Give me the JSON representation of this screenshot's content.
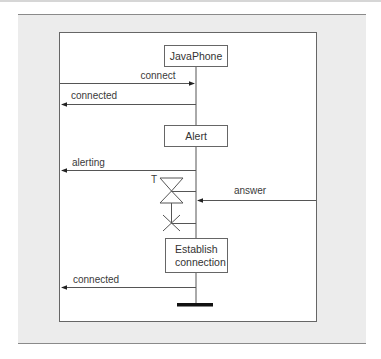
{
  "diagram": {
    "type": "sequence-diagram",
    "lifeline": "JavaPhone",
    "states": [
      {
        "id": "javaphone",
        "label": "JavaPhone"
      },
      {
        "id": "alert",
        "label": "Alert"
      },
      {
        "id": "establish",
        "lines": [
          "Establish",
          "connection"
        ]
      }
    ],
    "messages": [
      {
        "id": "connect",
        "label": "connect",
        "direction": "in"
      },
      {
        "id": "connected1",
        "label": "connected",
        "direction": "out"
      },
      {
        "id": "alerting",
        "label": "alerting",
        "direction": "out"
      },
      {
        "id": "answer",
        "label": "answer",
        "direction": "in"
      },
      {
        "id": "connected2",
        "label": "connected",
        "direction": "out"
      }
    ],
    "timer": {
      "label": "T"
    },
    "colors": {
      "line": "#555555",
      "panel": "#ececec",
      "box_fill": "#ffffff",
      "terminator": "#111111"
    }
  }
}
